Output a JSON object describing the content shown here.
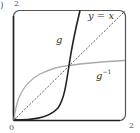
{
  "figure": {
    "panel_label": ")",
    "axes": {
      "origin_label": "0",
      "y_max_label": "2",
      "x_max_label": "2",
      "xlim": [
        0,
        2
      ],
      "ylim": [
        0,
        2
      ]
    },
    "curves": [
      {
        "name": "g",
        "label": "g",
        "style": "solid",
        "color": "#222222"
      },
      {
        "name": "identity",
        "label": "y = x",
        "style": "dashed",
        "color": "#444444"
      },
      {
        "name": "g-inverse",
        "label_base": "g",
        "label_sup": "−1",
        "style": "solid",
        "color": "#aaaaaa"
      }
    ],
    "intersection": {
      "x": 1,
      "y": 1
    }
  }
}
